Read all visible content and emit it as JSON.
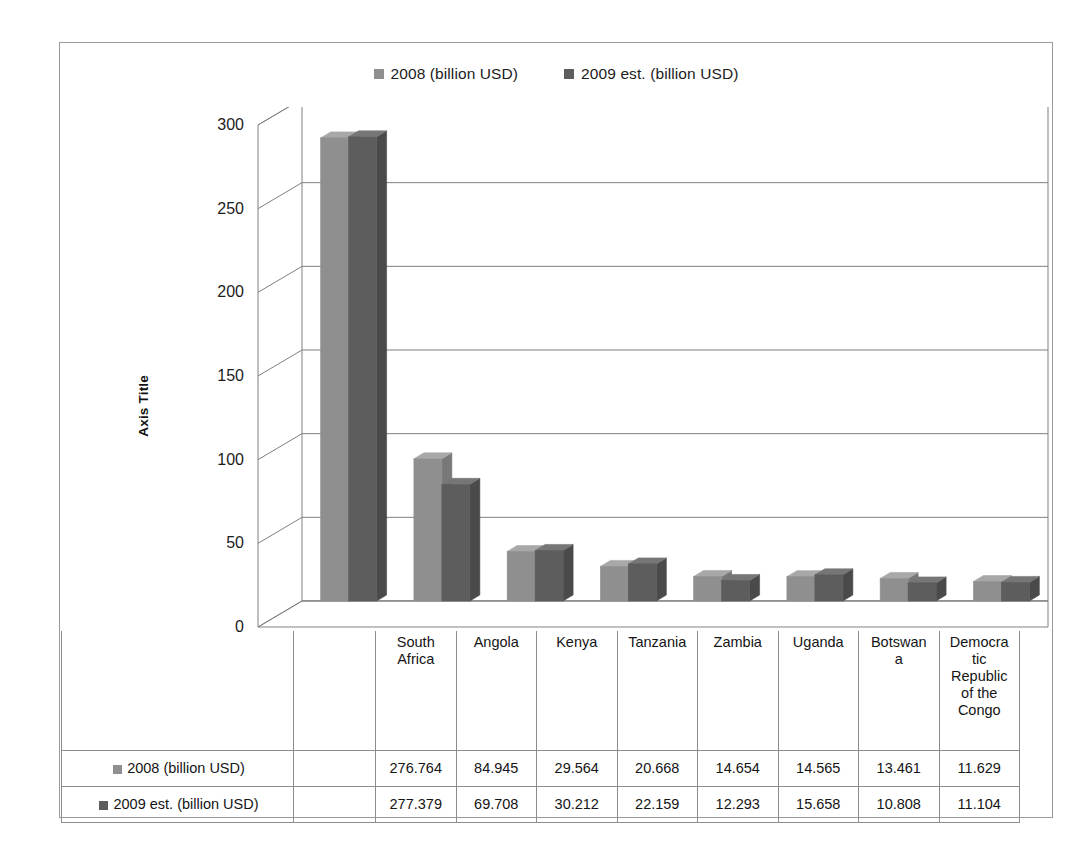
{
  "chart_data": {
    "type": "bar",
    "title": "",
    "subtitle": "",
    "xlabel": "",
    "ylabel": "Axis Title",
    "ylim": [
      0,
      300
    ],
    "ytick_values": [
      300,
      250,
      200,
      150,
      100,
      50,
      0
    ],
    "ytick_labels": [
      "300",
      "250",
      "200",
      "150",
      "100",
      "50",
      "0"
    ],
    "grid": true,
    "grid_axis": "y",
    "legend_position": "top-center",
    "three_d": true,
    "categories": [
      "South Africa",
      "Angola",
      "Kenya",
      "Tanzania",
      "Zambia",
      "Uganda",
      "Botswana",
      "Democratic Republic of the Congo"
    ],
    "category_labels_wrapped": [
      "South\nAfrica",
      "Angola",
      "Kenya",
      "Tanzania",
      "Zambia",
      "Uganda",
      "Botswan\na",
      "Democra\ntic\nRepublic\nof the\nCongo"
    ],
    "series": [
      {
        "name": "2008 (billion USD)",
        "color": "#8f8f8f",
        "values": [
          276.764,
          84.945,
          29.564,
          20.668,
          14.654,
          14.565,
          13.461,
          11.629
        ],
        "value_labels": [
          "276.764",
          "84.945",
          "29.564",
          "20.668",
          "14.654",
          "14.565",
          "13.461",
          "11.629"
        ]
      },
      {
        "name": "2009 est. (billion USD)",
        "color": "#5d5d5d",
        "values": [
          277.379,
          69.708,
          30.212,
          22.159,
          12.293,
          15.658,
          10.808,
          11.104
        ],
        "value_labels": [
          "277.379",
          "69.708",
          "30.212",
          "22.159",
          "12.293",
          "15.658",
          "10.808",
          "11.104"
        ]
      }
    ]
  },
  "legend": {
    "entries": [
      {
        "label": "2008 (billion USD)",
        "color": "#8f8f8f"
      },
      {
        "label": "2009 est. (billion USD)",
        "color": "#5d5d5d"
      }
    ]
  },
  "axis": {
    "y_title": "Axis Title"
  },
  "table": {
    "blank_header": "",
    "rows": [
      {
        "label": "2008 (billion USD)",
        "color": "#8f8f8f",
        "cells": [
          "276.764",
          "84.945",
          "29.564",
          "20.668",
          "14.654",
          "14.565",
          "13.461",
          "11.629"
        ]
      },
      {
        "label": "2009 est. (billion USD)",
        "color": "#5d5d5d",
        "cells": [
          "277.379",
          "69.708",
          "30.212",
          "22.159",
          "12.293",
          "15.658",
          "10.808",
          "11.104"
        ]
      }
    ]
  },
  "colors": {
    "series_2008": "#8f8f8f",
    "series_2008_top": "#a8a8a8",
    "series_2008_side": "#787878",
    "series_2009": "#5d5d5d",
    "series_2009_top": "#767676",
    "series_2009_side": "#4a4a4a",
    "grid": "#808080",
    "frame": "#9a9a9a",
    "table_border": "#8d8d8d",
    "text": "#1a1a1a"
  }
}
